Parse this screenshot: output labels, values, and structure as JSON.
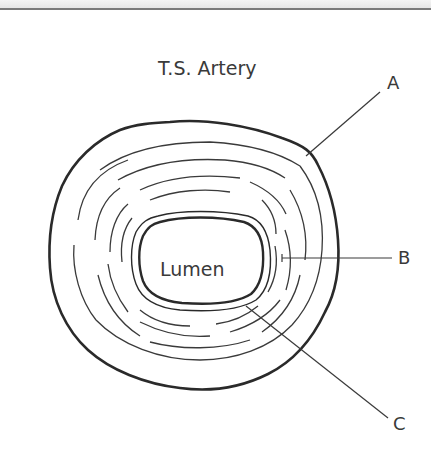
{
  "diagram": {
    "title": "T.S. Artery",
    "center_label": "Lumen",
    "labels": [
      {
        "id": "A",
        "text": "A",
        "points_to": "outer wall"
      },
      {
        "id": "B",
        "text": "B",
        "points_to": "middle layer"
      },
      {
        "id": "C",
        "text": "C",
        "points_to": "inner lining"
      }
    ],
    "colors": {
      "stroke": "#2a2a2a",
      "text": "#3a3a3a",
      "background": "#ffffff"
    }
  }
}
